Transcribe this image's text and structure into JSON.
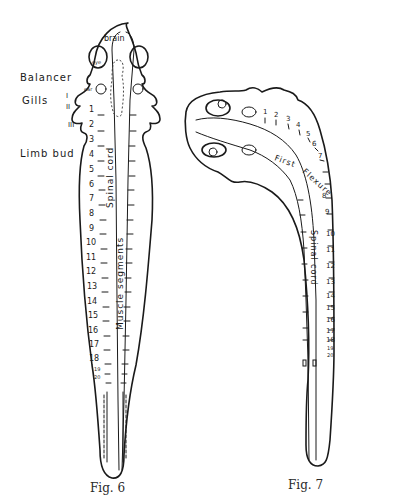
{
  "figures": [
    {
      "id": "fig6",
      "caption": "Fig. 6",
      "view": "dorsal",
      "labels": {
        "brain": "brain",
        "eye": "eye",
        "ear": "ear",
        "balancer": "Balancer",
        "gills": "Gills",
        "gill_numerals": [
          "I",
          "II",
          "III"
        ],
        "limb_bud": "Limb bud",
        "spinal_cord": "Spinal cord",
        "muscle_segments": "Muscle segments"
      },
      "segment_numbers": [
        "1",
        "2",
        "3",
        "4",
        "5",
        "6",
        "7",
        "8",
        "9",
        "10",
        "11",
        "12",
        "13",
        "14",
        "15",
        "16",
        "17",
        "18",
        "19",
        "20"
      ]
    },
    {
      "id": "fig7",
      "caption": "Fig. 7",
      "view": "lateral",
      "labels": {
        "first_flexure": "First flexure",
        "spinal_cord": "Spinal cord"
      },
      "segment_numbers": [
        "1",
        "2",
        "3",
        "4",
        "5",
        "6",
        "7",
        "8",
        "9",
        "10",
        "11",
        "12",
        "13",
        "14",
        "15",
        "16",
        "17",
        "18",
        "19",
        "20"
      ]
    }
  ]
}
